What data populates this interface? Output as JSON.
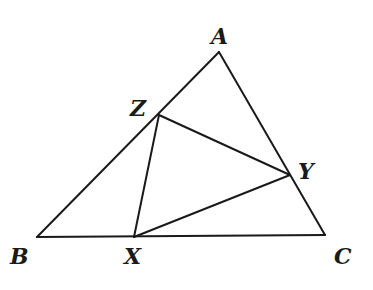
{
  "diagram": {
    "type": "geometry",
    "vertices": {
      "A": {
        "label": "A"
      },
      "B": {
        "label": "B"
      },
      "C": {
        "label": "C"
      },
      "X": {
        "label": "X"
      },
      "Y": {
        "label": "Y"
      },
      "Z": {
        "label": "Z"
      }
    },
    "outer_triangle": [
      "A",
      "B",
      "C"
    ],
    "inner_triangle": [
      "X",
      "Y",
      "Z"
    ],
    "incidence": {
      "X": "on segment BC",
      "Y": "on segment CA",
      "Z": "on segment AB"
    },
    "colors": {
      "stroke": "#1a1a1a",
      "background": "#ffffff"
    }
  }
}
